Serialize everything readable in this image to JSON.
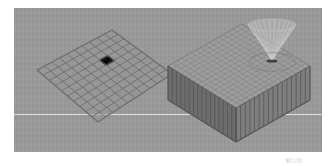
{
  "figure": {
    "title": "3D mesh comparison render",
    "background_color": "#ffffff",
    "panel_color": "#9a9a9a",
    "panel_rect": {
      "x": 14,
      "y": 8,
      "width": 308,
      "height": 144
    },
    "horizon_label": "horizon line",
    "horizon_color": "#e8e8e8",
    "corner_mark_label": "faint corner artifact"
  },
  "objects": [
    {
      "id": "flat-grid",
      "label": "Flat quad mesh with selected cell",
      "type": "wireframe-grid",
      "rows": 10,
      "cols": 10,
      "line_color": "#6b6b6b",
      "fill_color": "#969696",
      "highlight": {
        "label": "selected cell",
        "row": 3,
        "col": 6,
        "color": "#0c0c0c"
      },
      "corners": {
        "back": {
          "x": 98,
          "y": 22
        },
        "right": {
          "x": 158,
          "y": 66
        },
        "front": {
          "x": 84,
          "y": 114
        },
        "left": {
          "x": 23,
          "y": 62
        }
      }
    },
    {
      "id": "extruded-block",
      "label": "Extruded volume mesh with funnel deformation",
      "type": "extruded-block",
      "rows": 16,
      "cols": 16,
      "depth": 34,
      "top_color": "#9c9c9c",
      "left_face_color": "#6d6d6d",
      "right_face_color": "#7e7e7e",
      "line_color": "#7a7a7a",
      "corners": {
        "back": {
          "x": 228,
          "y": 16
        },
        "right": {
          "x": 296,
          "y": 58
        },
        "front": {
          "x": 222,
          "y": 100
        },
        "left": {
          "x": 154,
          "y": 58
        }
      },
      "feature": {
        "label": "funnel crater spike",
        "type": "radial-funnel",
        "center": {
          "x": 258,
          "y": 53
        },
        "height": 36,
        "radius_x": 24,
        "radius_y": 11,
        "spoke_count": 26,
        "color": "#c2c2c2"
      }
    }
  ]
}
